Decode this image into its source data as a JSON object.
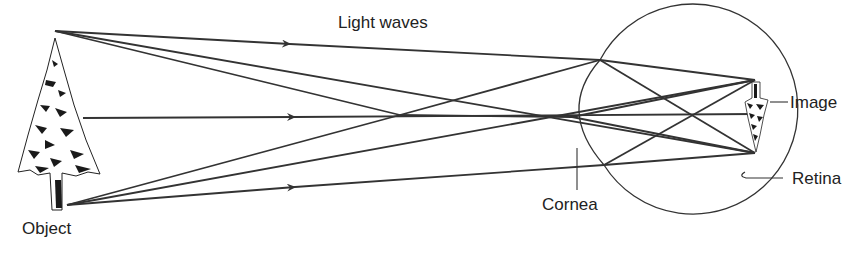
{
  "diagram": {
    "title": "Light waves",
    "labels": {
      "object": "Object",
      "cornea": "Cornea",
      "image": "Image",
      "retina": "Retina"
    },
    "colors": {
      "line": "#333333",
      "text": "#222222",
      "background": "#ffffff"
    },
    "elements": {
      "object": "upright tree",
      "image": "inverted tree on retina",
      "eye": "circle with cornea bulge"
    }
  }
}
